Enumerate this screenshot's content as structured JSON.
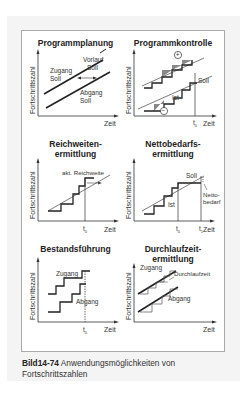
{
  "figure": {
    "axis_labels": {
      "y": "Fortschrittszahl",
      "x": "Zeit"
    },
    "panels": [
      {
        "title": "Programmplanung",
        "labels": {
          "zugang": "Zugang",
          "zugang_soll": "Soll",
          "vorlauf": "Vorlauf",
          "vorlauf_soll": "Soll",
          "abgang": "Abgang",
          "abgang_soll": "Soll"
        }
      },
      {
        "title": "Programmkontrolle",
        "labels": {
          "plus": "+",
          "minus": "−",
          "soll": "Soll",
          "ist": "Ist",
          "t0": "t",
          "t0_sub": "0"
        }
      },
      {
        "title_line1": "Reichweiten-",
        "title_line2": "ermittlung",
        "labels": {
          "reichweite": "akt. Reichweite",
          "t0": "t",
          "t0_sub": "0"
        }
      },
      {
        "title_line1": "Nettobedarfs-",
        "title_line2": "ermittlung",
        "labels": {
          "soll": "Soll",
          "ist": "Ist",
          "netto1": "Netto-",
          "netto2": "bedarf",
          "t0": "t",
          "t0_sub": "0",
          "t1": "t",
          "t1_sub": "1"
        }
      },
      {
        "title": "Bestandsführung",
        "labels": {
          "zugang": "Zugang",
          "abgang": "Abgang",
          "t0": "t",
          "t0_sub": "0"
        }
      },
      {
        "title_line1": "Durchlaufzeit-",
        "title_line2": "ermittlung",
        "labels": {
          "zugang": "Zugang",
          "durchlaufzeit": "Durchlaufzeit",
          "abgang": "Abgang"
        }
      }
    ]
  },
  "caption": {
    "number": "Bild14-74",
    "text": " Anwendungsmöglichkeiten von Fortschrittszahlen"
  }
}
